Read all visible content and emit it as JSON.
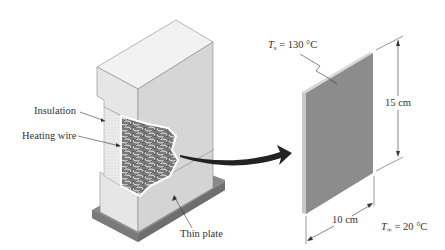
{
  "figure": {
    "left_assembly": {
      "labels": {
        "insulation": "Insulation",
        "heating_wire": "Heating wire",
        "thin_plate": "Thin plate"
      }
    },
    "plate": {
      "surface_temp_symbol": "T",
      "surface_temp_subscript": "s",
      "surface_temp_value": "= 130 °C",
      "height_label": "15 cm",
      "width_label": "10 cm",
      "ambient_temp_symbol": "T",
      "ambient_temp_subscript": "∞",
      "ambient_temp_value": "= 20 °C"
    },
    "colors": {
      "box_top": "#f2f2f2",
      "box_front": "#e4e4e4",
      "box_side": "#d6d6d6",
      "base": "#8a8a8a",
      "plate_face": "#8c8c8c",
      "plate_edge": "#d8d8d8",
      "arrow": "#222222",
      "coil": "#555555"
    }
  }
}
